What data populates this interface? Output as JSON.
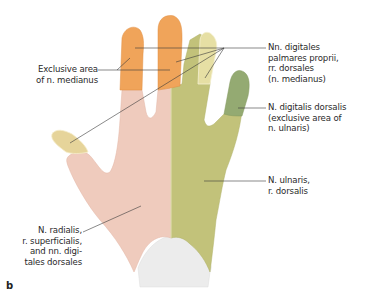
{
  "figure": {
    "panel_letter": "b",
    "colors": {
      "median_exclusive": "#f0a45a",
      "median_dorsal_tip": "#e3dc9c",
      "radial_area": "#efcbbd",
      "ulnar_area": "#c2c27a",
      "ulnar_exclusive": "#94aa72",
      "wrist": "#eeeeee",
      "leader_line": "#3a3a3a"
    },
    "labels": {
      "exclusive_median": [
        "Exclusive area",
        "of n. medianus"
      ],
      "nn_digitales": [
        "Nn. digitales",
        "palmares proprii,",
        "rr. dorsales",
        "(n. medianus)"
      ],
      "n_digitalis_dorsalis": [
        "N. digitalis dorsalis",
        "(exclusive area of",
        "n. ulnaris)"
      ],
      "n_ulnaris": [
        "N. ulnaris,",
        "r. dorsalis"
      ],
      "n_radialis": [
        "N. radialis,",
        "r. superficialis,",
        "and nn. digi-",
        "tales dorsales"
      ]
    }
  }
}
